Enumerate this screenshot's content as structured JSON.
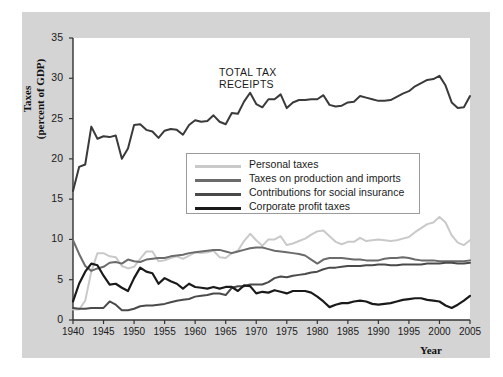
{
  "figure": {
    "y_axis_label_line1": "Taxes",
    "y_axis_label_line2": "(percent of GDP)",
    "x_axis_label": "Year",
    "annotation_line1": "TOTAL TAX",
    "annotation_line2": "RECEIPTS"
  },
  "legend": {
    "entries": [
      {
        "label": "Personal taxes",
        "color": "#c9c9c9"
      },
      {
        "label": "Taxes on production and imports",
        "color": "#6b6b6b"
      },
      {
        "label": "Contributions for social insurance",
        "color": "#4a4a4a"
      },
      {
        "label": "Corporate profit taxes",
        "color": "#1a1a1a"
      }
    ]
  },
  "chart_data": {
    "type": "line",
    "title": "",
    "xlabel": "Year",
    "ylabel": "Taxes (percent of GDP)",
    "xlim": [
      1940,
      2005
    ],
    "ylim": [
      0,
      35
    ],
    "xticks": [
      1940,
      1945,
      1950,
      1955,
      1960,
      1965,
      1970,
      1975,
      1980,
      1985,
      1990,
      1995,
      2000,
      2005
    ],
    "yticks": [
      0,
      5,
      10,
      15,
      20,
      25,
      30,
      35
    ],
    "grid": false,
    "legend_position": "center",
    "annotations": [
      {
        "text": "TOTAL TAX RECEIPTS",
        "x": 1966,
        "y": 31.5
      }
    ],
    "x": [
      1940,
      1941,
      1942,
      1943,
      1944,
      1945,
      1946,
      1947,
      1948,
      1949,
      1950,
      1951,
      1952,
      1953,
      1954,
      1955,
      1956,
      1957,
      1958,
      1959,
      1960,
      1961,
      1962,
      1963,
      1964,
      1965,
      1966,
      1967,
      1968,
      1969,
      1970,
      1971,
      1972,
      1973,
      1974,
      1975,
      1976,
      1977,
      1978,
      1979,
      1980,
      1981,
      1982,
      1983,
      1984,
      1985,
      1986,
      1987,
      1988,
      1989,
      1990,
      1991,
      1992,
      1993,
      1994,
      1995,
      1996,
      1997,
      1998,
      1999,
      2000,
      2001,
      2002,
      2003,
      2004,
      2005
    ],
    "series": [
      {
        "name": "Total tax receipts",
        "color": "#3a3a3a",
        "width": 2.0,
        "values": [
          16.0,
          19.0,
          19.3,
          24.0,
          22.5,
          22.8,
          22.7,
          22.9,
          20.0,
          21.3,
          24.2,
          24.3,
          23.6,
          23.4,
          22.6,
          23.5,
          23.7,
          23.6,
          23.0,
          24.2,
          24.8,
          24.6,
          24.7,
          25.4,
          24.6,
          24.3,
          25.7,
          25.6,
          27.1,
          28.2,
          26.8,
          26.4,
          27.4,
          27.4,
          28.0,
          26.3,
          27.0,
          27.3,
          27.3,
          27.4,
          27.4,
          27.9,
          26.7,
          26.5,
          26.6,
          27.0,
          27.1,
          27.8,
          27.6,
          27.4,
          27.2,
          27.2,
          27.3,
          27.7,
          28.1,
          28.4,
          29.0,
          29.4,
          29.8,
          29.9,
          30.3,
          29.1,
          27.0,
          26.3,
          26.4,
          27.8
        ]
      },
      {
        "name": "Personal taxes",
        "color": "#c9c9c9",
        "width": 2.0,
        "values": [
          1.3,
          1.3,
          2.4,
          6.0,
          8.3,
          8.3,
          7.9,
          7.8,
          6.7,
          6.4,
          6.6,
          7.6,
          8.5,
          8.5,
          7.3,
          7.4,
          7.7,
          7.9,
          7.6,
          8.0,
          8.4,
          8.3,
          8.4,
          8.6,
          7.8,
          7.7,
          8.3,
          8.6,
          9.8,
          10.7,
          9.9,
          9.2,
          10.0,
          10.0,
          10.4,
          9.3,
          9.5,
          9.8,
          10.1,
          10.6,
          11.0,
          11.1,
          10.4,
          9.7,
          9.4,
          9.7,
          9.7,
          10.2,
          9.8,
          9.9,
          10.0,
          9.9,
          9.8,
          9.9,
          10.1,
          10.3,
          10.9,
          11.4,
          11.9,
          12.1,
          12.8,
          12.1,
          10.5,
          9.6,
          9.3,
          9.9
        ]
      },
      {
        "name": "Taxes on production and imports",
        "color": "#6b6b6b",
        "width": 2.0,
        "values": [
          9.9,
          8.2,
          6.7,
          6.1,
          6.4,
          6.6,
          7.1,
          7.2,
          7.0,
          7.5,
          7.3,
          7.2,
          7.5,
          7.6,
          7.7,
          7.7,
          7.9,
          8.0,
          8.1,
          8.3,
          8.4,
          8.5,
          8.6,
          8.7,
          8.7,
          8.5,
          8.3,
          8.5,
          8.7,
          8.9,
          9.0,
          9.0,
          8.8,
          8.6,
          8.5,
          8.4,
          8.3,
          8.2,
          8.0,
          7.5,
          7.0,
          7.5,
          7.7,
          7.7,
          7.7,
          7.6,
          7.5,
          7.5,
          7.4,
          7.4,
          7.4,
          7.6,
          7.7,
          7.7,
          7.8,
          7.7,
          7.5,
          7.4,
          7.4,
          7.4,
          7.3,
          7.3,
          7.3,
          7.3,
          7.3,
          7.4
        ]
      },
      {
        "name": "Contributions for social insurance",
        "color": "#4a4a4a",
        "width": 2.0,
        "values": [
          1.5,
          1.4,
          1.4,
          1.5,
          1.5,
          1.5,
          2.3,
          1.9,
          1.2,
          1.2,
          1.4,
          1.7,
          1.8,
          1.8,
          1.9,
          2.0,
          2.2,
          2.4,
          2.5,
          2.6,
          2.9,
          3.0,
          3.1,
          3.3,
          3.3,
          3.1,
          4.0,
          4.2,
          4.2,
          4.4,
          4.4,
          4.4,
          4.7,
          5.2,
          5.4,
          5.3,
          5.5,
          5.6,
          5.7,
          5.9,
          6.0,
          6.3,
          6.5,
          6.5,
          6.6,
          6.7,
          6.7,
          6.7,
          6.8,
          6.8,
          6.9,
          6.9,
          6.8,
          6.8,
          6.9,
          6.9,
          6.9,
          6.9,
          7.0,
          7.0,
          7.0,
          7.1,
          7.1,
          7.0,
          7.0,
          7.1
        ]
      },
      {
        "name": "Corporate profit taxes",
        "color": "#1a1a1a",
        "width": 2.2,
        "values": [
          2.3,
          4.5,
          6.0,
          7.0,
          6.8,
          5.5,
          4.4,
          4.5,
          4.0,
          3.6,
          5.2,
          6.5,
          6.0,
          5.8,
          4.5,
          5.2,
          4.8,
          4.5,
          3.9,
          4.5,
          4.1,
          4.0,
          3.9,
          4.1,
          3.9,
          4.1,
          4.1,
          3.6,
          4.3,
          4.2,
          3.3,
          3.5,
          3.4,
          3.7,
          3.5,
          3.3,
          3.6,
          3.6,
          3.6,
          3.4,
          2.9,
          2.3,
          1.6,
          1.9,
          2.1,
          2.1,
          2.3,
          2.4,
          2.3,
          2.0,
          1.9,
          2.0,
          2.1,
          2.3,
          2.5,
          2.6,
          2.7,
          2.7,
          2.5,
          2.4,
          2.3,
          1.8,
          1.5,
          1.9,
          2.4,
          3.0
        ]
      }
    ]
  }
}
